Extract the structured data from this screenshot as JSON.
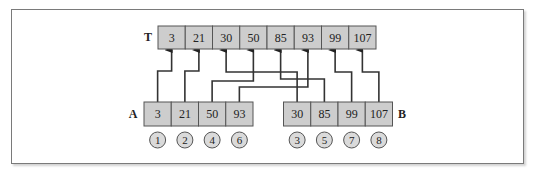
{
  "figure": {
    "frame_color": "#7a7a7a",
    "cell_fill": "#cdcdcd",
    "circle_fill": "#dadada"
  },
  "arrays": {
    "T": {
      "label": "T",
      "values": [
        "3",
        "21",
        "30",
        "50",
        "85",
        "93",
        "99",
        "107"
      ]
    },
    "A": {
      "label": "A",
      "values": [
        "3",
        "21",
        "50",
        "93"
      ],
      "order": [
        "1",
        "2",
        "4",
        "6"
      ]
    },
    "B": {
      "label": "B",
      "values": [
        "30",
        "85",
        "99",
        "107"
      ],
      "order": [
        "3",
        "5",
        "7",
        "8"
      ]
    }
  },
  "connections": [
    {
      "from": "A",
      "from_index": 0,
      "to_index": 0,
      "bend_y": 71
    },
    {
      "from": "A",
      "from_index": 1,
      "to_index": 1,
      "bend_y": 71
    },
    {
      "from": "B",
      "from_index": 0,
      "to_index": 2,
      "bend_y": 72
    },
    {
      "from": "A",
      "from_index": 2,
      "to_index": 3,
      "bend_y": 81
    },
    {
      "from": "B",
      "from_index": 1,
      "to_index": 4,
      "bend_y": 79
    },
    {
      "from": "A",
      "from_index": 3,
      "to_index": 5,
      "bend_y": 87
    },
    {
      "from": "B",
      "from_index": 2,
      "to_index": 6,
      "bend_y": 72
    },
    {
      "from": "B",
      "from_index": 3,
      "to_index": 7,
      "bend_y": 72
    }
  ]
}
